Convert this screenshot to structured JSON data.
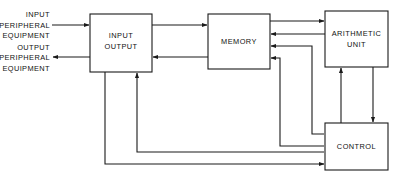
{
  "diagram": {
    "type": "block-diagram",
    "background_color": "#ffffff",
    "line_color": "#1a1a1a",
    "text_color": "#111111",
    "blocks": [
      {
        "id": "input-output",
        "label_line1": "INPUT",
        "label_line2": "OUTPUT",
        "x": 90,
        "y": 14,
        "width": 62,
        "height": 58
      },
      {
        "id": "memory",
        "label_line1": "MEMORY",
        "label_line2": "",
        "x": 208,
        "y": 14,
        "width": 62,
        "height": 55
      },
      {
        "id": "arithmetic-unit",
        "label_line1": "ARITHMETIC",
        "label_line2": "UNIT",
        "x": 325,
        "y": 11,
        "width": 63,
        "height": 56
      },
      {
        "id": "control",
        "label_line1": "CONTROL",
        "label_line2": "",
        "x": 325,
        "y": 123,
        "width": 63,
        "height": 47
      }
    ],
    "peripheral_labels": [
      {
        "id": "input-peripheral",
        "line1": "INPUT",
        "line2": "PERIPHERAL",
        "line3": "EQUIPMENT",
        "direction": "into-input-output"
      },
      {
        "id": "output-peripheral",
        "line1": "OUTPUT",
        "line2": "PERIPHERAL",
        "line3": "EQUIPMENT",
        "direction": "out-of-input-output"
      }
    ],
    "connections": [
      {
        "id": "input-peripheral-to-io",
        "from": "input-peripheral",
        "to": "input-output"
      },
      {
        "id": "io-to-output-peripheral",
        "from": "input-output",
        "to": "output-peripheral"
      },
      {
        "id": "io-to-memory",
        "from": "input-output",
        "to": "memory"
      },
      {
        "id": "memory-to-io",
        "from": "memory",
        "to": "input-output"
      },
      {
        "id": "memory-to-arithmetic",
        "from": "memory",
        "to": "arithmetic-unit"
      },
      {
        "id": "arithmetic-to-memory",
        "from": "arithmetic-unit",
        "to": "memory"
      },
      {
        "id": "control-to-memory-upper",
        "from": "control",
        "to": "memory"
      },
      {
        "id": "control-to-memory-lower",
        "from": "control",
        "to": "memory"
      },
      {
        "id": "arithmetic-to-control",
        "from": "arithmetic-unit",
        "to": "control"
      },
      {
        "id": "control-to-arithmetic",
        "from": "control",
        "to": "arithmetic-unit"
      },
      {
        "id": "control-to-io",
        "from": "control",
        "to": "input-output"
      },
      {
        "id": "io-to-control",
        "from": "input-output",
        "to": "control"
      }
    ]
  }
}
